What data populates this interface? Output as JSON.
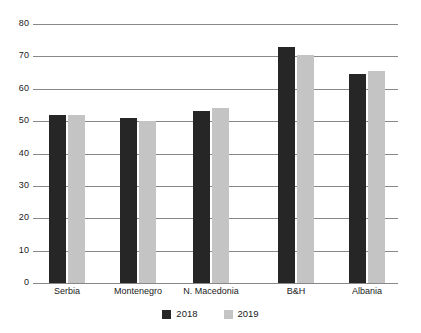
{
  "chart_data": {
    "type": "bar",
    "title": "",
    "subtitle": "",
    "xlabel": "",
    "ylabel": "",
    "categories": [
      "Serbia",
      "Montenegro",
      "N. Macedonia",
      "B&H",
      "Albania"
    ],
    "series": [
      {
        "name": "2018",
        "color": "#262626",
        "values": [
          52,
          51,
          53,
          73,
          64.5
        ]
      },
      {
        "name": "2019",
        "color": "#c4c4c4",
        "values": [
          52,
          50,
          54,
          70.5,
          65.5
        ]
      }
    ],
    "ylim": [
      0,
      80
    ],
    "y_ticks": [
      0,
      10,
      20,
      30,
      40,
      50,
      60,
      70,
      80
    ],
    "y_tick_labels": [
      "0",
      "10",
      "20",
      "30",
      "40",
      "50",
      "60",
      "70",
      "80"
    ],
    "grid": true,
    "grid_color": "#888888",
    "legend_position": "bottom-center",
    "legend_entries": [
      "2018",
      "2019"
    ],
    "background": "#ffffff",
    "annotations": []
  }
}
